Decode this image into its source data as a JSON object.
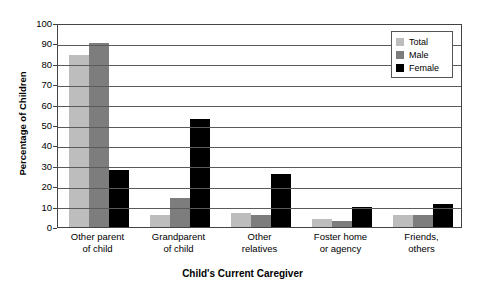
{
  "chart_data": {
    "type": "bar",
    "title": "",
    "xlabel": "Child's Current Caregiver",
    "ylabel": "Percentage of Children",
    "ylim": [
      0,
      100
    ],
    "ytick_step": 10,
    "yticks": [
      0,
      10,
      20,
      30,
      40,
      50,
      60,
      70,
      80,
      90,
      100
    ],
    "grid": true,
    "legend_position": "top-right",
    "categories": [
      "Other parent\nof child",
      "Grandparent\nof child",
      "Other\nrelatives",
      "Foster home\nor agency",
      "Friends,\nothers"
    ],
    "series": [
      {
        "name": "Total",
        "color": "#bdbdbd",
        "values": [
          84.5,
          6,
          7,
          4,
          6
        ]
      },
      {
        "name": "Male",
        "color": "#7d7d7d",
        "values": [
          90,
          14,
          6,
          3,
          6
        ]
      },
      {
        "name": "Female",
        "color": "#000000",
        "values": [
          28,
          53,
          26,
          10,
          11.5
        ]
      }
    ]
  }
}
